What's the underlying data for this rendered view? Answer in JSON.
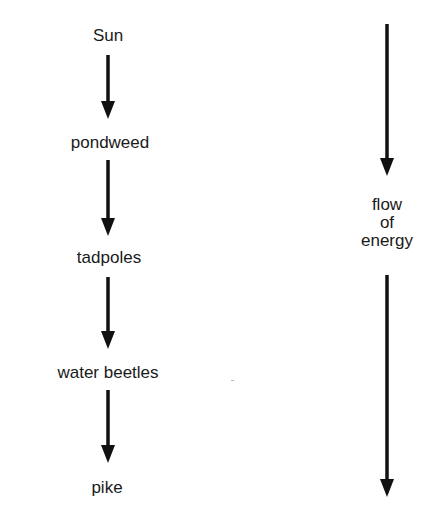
{
  "diagram": {
    "type": "food-chain",
    "chain": [
      {
        "label": "Sun"
      },
      {
        "label": "pondweed"
      },
      {
        "label": "tadpoles"
      },
      {
        "label": "water beetles"
      },
      {
        "label": "pike"
      }
    ],
    "flow_label": {
      "lines": [
        "flow",
        "of",
        "energy"
      ]
    },
    "colors": {
      "text": "#1a1a1a",
      "arrow": "#111111",
      "background": "#ffffff"
    }
  }
}
